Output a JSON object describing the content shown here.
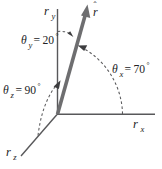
{
  "figure": {
    "type": "vector-direction-angles-diagram",
    "background_color": "#ffffff",
    "axis_color": "#58585a",
    "vector_color": "#6e6e70",
    "arc_color": "#5a5a5c",
    "text_color": "#232325"
  },
  "vector": {
    "name": "r-hat",
    "symbol": "r",
    "hat": "ˆ",
    "label_base": "r",
    "description": "unit vector drawn from origin up and to the right"
  },
  "axes": [
    {
      "id": "y",
      "label_base": "r",
      "label_sub": "y",
      "label_text": "rᵧ",
      "orientation": "vertical-up"
    },
    {
      "id": "x",
      "label_base": "r",
      "label_sub": "x",
      "label_text": "rₓ",
      "orientation": "horizontal-right"
    },
    {
      "id": "z",
      "label_base": "r",
      "label_sub": "z",
      "label_text": "rᵩ",
      "orientation": "oblique-down-left"
    }
  ],
  "angles": [
    {
      "id": "theta-y",
      "symbol": "θ",
      "subscript": "y",
      "equals": "=",
      "value": "20",
      "degree": "°",
      "full_text": "θᵧ = 20°",
      "measured_from_axis": "y"
    },
    {
      "id": "theta-x",
      "symbol": "θ",
      "subscript": "x",
      "equals": "=",
      "value": "70",
      "degree": "°",
      "full_text": "θₓ = 70°",
      "measured_from_axis": "x"
    },
    {
      "id": "theta-z",
      "symbol": "θ",
      "subscript": "z",
      "equals": "=",
      "value": "90",
      "degree": "°",
      "full_text": "θᵩ = 90°",
      "measured_from_axis": "z"
    }
  ]
}
